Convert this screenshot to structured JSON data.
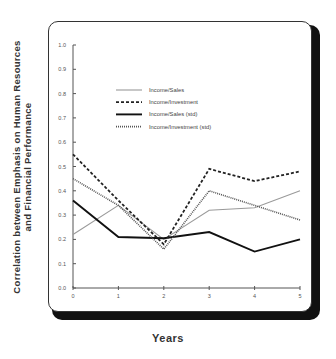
{
  "chart_data": {
    "type": "line",
    "title": "",
    "xlabel": "Years",
    "ylabel_lines": [
      "Correlation between Emphasis on Human Resources",
      "and Financial Performance"
    ],
    "ylabel": "Correlation between Emphasis on Human Resources and Financial Performance",
    "x": [
      0,
      1,
      2,
      3,
      4,
      5
    ],
    "x_tick_labels": [
      "0",
      "1",
      "2",
      "3",
      "4",
      "5"
    ],
    "y_tick_labels": [
      "0.0",
      "0.1",
      "0.2",
      "0.3",
      "0.4",
      "0.5",
      "0.6",
      "0.7",
      "0.8",
      "0.9",
      "1.0"
    ],
    "ylim": [
      0.0,
      1.0
    ],
    "xlim": [
      0,
      5
    ],
    "grid": false,
    "legend_position": "upper center (inside plot)",
    "series": [
      {
        "name": "Income/Sales",
        "values": [
          0.22,
          0.34,
          0.2,
          0.32,
          0.33,
          0.4
        ],
        "color": "#9a9a9a",
        "style": "solid-thin"
      },
      {
        "name": "Income/Investment",
        "values": [
          0.55,
          0.36,
          0.18,
          0.49,
          0.44,
          0.48
        ],
        "color": "#222222",
        "style": "dashed"
      },
      {
        "name": "Income/Sales (std)",
        "values": [
          0.36,
          0.21,
          0.205,
          0.23,
          0.15,
          0.2
        ],
        "color": "#111111",
        "style": "solid-thick"
      },
      {
        "name": "Income/Investment (std)",
        "values": [
          0.45,
          0.34,
          0.16,
          0.4,
          0.34,
          0.28
        ],
        "color": "#555555",
        "style": "dotted"
      }
    ]
  }
}
